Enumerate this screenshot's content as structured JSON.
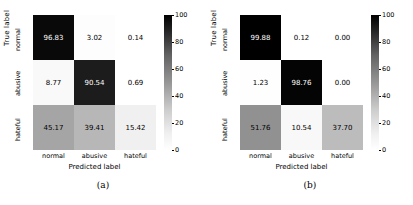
{
  "figure": {
    "axis": {
      "ylabel": "True label",
      "xlabel": "Predicted label",
      "classes": [
        "normal",
        "abusive",
        "hateful"
      ]
    },
    "colorbar": {
      "ticks": [
        "100",
        "80",
        "60",
        "40",
        "20",
        "0"
      ],
      "vmin": 0,
      "vmax": 100,
      "cmap_low": "#ffffff",
      "cmap_high": "#000000"
    },
    "panels": [
      {
        "caption": "(a)"
      },
      {
        "caption": "(b)"
      }
    ]
  },
  "chart_data": [
    {
      "type": "heatmap",
      "title": "(a)",
      "xlabel": "Predicted label",
      "ylabel": "True label",
      "categories": [
        "normal",
        "abusive",
        "hateful"
      ],
      "row_labels": [
        "normal",
        "abusive",
        "hateful"
      ],
      "col_labels": [
        "normal",
        "abusive",
        "hateful"
      ],
      "values": [
        [
          96.83,
          3.02,
          0.14
        ],
        [
          8.77,
          90.54,
          0.69
        ],
        [
          45.17,
          39.41,
          15.42
        ]
      ],
      "cell_text": [
        [
          "96.83",
          "3.02",
          "0.14"
        ],
        [
          "8.77",
          "90.54",
          "0.69"
        ],
        [
          "45.17",
          "39.41",
          "15.42"
        ]
      ],
      "zlim": [
        0,
        100
      ],
      "grid": false,
      "legend": "colorbar-right"
    },
    {
      "type": "heatmap",
      "title": "(b)",
      "xlabel": "Predicted label",
      "ylabel": "True label",
      "categories": [
        "normal",
        "abusive",
        "hateful"
      ],
      "row_labels": [
        "normal",
        "abusive",
        "hateful"
      ],
      "col_labels": [
        "normal",
        "abusive",
        "hateful"
      ],
      "values": [
        [
          99.88,
          0.12,
          0.0
        ],
        [
          1.23,
          98.76,
          0.0
        ],
        [
          51.76,
          10.54,
          37.7
        ]
      ],
      "cell_text": [
        [
          "99.88",
          "0.12",
          "0.00"
        ],
        [
          "1.23",
          "98.76",
          "0.00"
        ],
        [
          "51.76",
          "10.54",
          "37.70"
        ]
      ],
      "zlim": [
        0,
        100
      ],
      "grid": false,
      "legend": "colorbar-right"
    }
  ]
}
